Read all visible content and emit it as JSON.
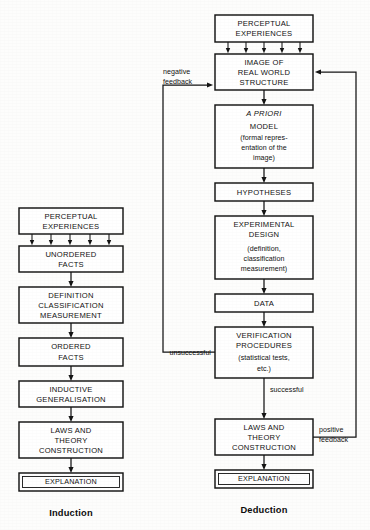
{
  "diagram": {
    "title_induction": "Induction",
    "title_deduction": "Deduction",
    "colors": {
      "background": "#fdfdfc",
      "stroke": "#141414",
      "text": "#111111",
      "box_fill": "#ffffff"
    }
  },
  "induction": {
    "footer_label": "Induction",
    "boxes": [
      {
        "id": "perceptual_experiences",
        "lines": [
          "PERCEPTUAL",
          "EXPERIENCES"
        ]
      },
      {
        "id": "unordered_facts",
        "lines": [
          "UNORDERED",
          "FACTS"
        ]
      },
      {
        "id": "definition_classification_measurement",
        "lines": [
          "DEFINITION",
          "CLASSIFICATION",
          "MEASUREMENT"
        ]
      },
      {
        "id": "ordered_facts",
        "lines": [
          "ORDERED",
          "FACTS"
        ]
      },
      {
        "id": "inductive_generalisation",
        "lines": [
          "INDUCTIVE",
          "GENERALISATION"
        ]
      },
      {
        "id": "laws_and_theory_construction",
        "lines": [
          "LAWS AND",
          "THEORY",
          "CONSTRUCTION"
        ]
      },
      {
        "id": "explanation",
        "lines": [
          "EXPLANATION"
        ]
      }
    ]
  },
  "deduction": {
    "footer_label": "Deduction",
    "boxes": [
      {
        "id": "perceptual_experiences",
        "lines": [
          "PERCEPTUAL",
          "EXPERIENCES"
        ]
      },
      {
        "id": "image_of_real_world_structure",
        "lines": [
          "IMAGE OF",
          "REAL  WORLD",
          "STRUCTURE"
        ]
      },
      {
        "id": "a_priori_model",
        "lines": [
          "A PRIORI",
          "MODEL",
          "(formal repres-",
          "entation of the",
          "image)"
        ]
      },
      {
        "id": "hypotheses",
        "lines": [
          "HYPOTHESES"
        ]
      },
      {
        "id": "experimental_design",
        "lines": [
          "EXPERIMENTAL",
          "DESIGN",
          "(definition,",
          "classification",
          "measurement)"
        ]
      },
      {
        "id": "data",
        "lines": [
          "DATA"
        ]
      },
      {
        "id": "verification_procedures",
        "lines": [
          "VERIFICATION",
          "PROCEDURES",
          "(statistical tests,",
          "etc.)"
        ]
      },
      {
        "id": "laws_and_theory_construction",
        "lines": [
          "LAWS AND",
          "THEORY",
          "CONSTRUCTION"
        ]
      },
      {
        "id": "explanation",
        "lines": [
          "EXPLANATION"
        ]
      }
    ],
    "edge_labels": {
      "negative_feedback_line1": "negative",
      "negative_feedback_line2": "feedback",
      "unsuccessful": "unsuccessful",
      "successful": "successful",
      "positive_feedback_line1": "positive",
      "positive_feedback_line2": "feedback"
    }
  }
}
